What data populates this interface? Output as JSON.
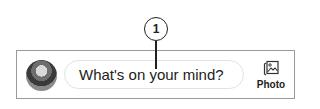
{
  "callout": {
    "number": "1"
  },
  "composer": {
    "avatar_alt": "user profile photo",
    "input_placeholder": "What's on your mind?",
    "photo_button": {
      "label": "Photo",
      "icon": "photo-icon"
    }
  }
}
